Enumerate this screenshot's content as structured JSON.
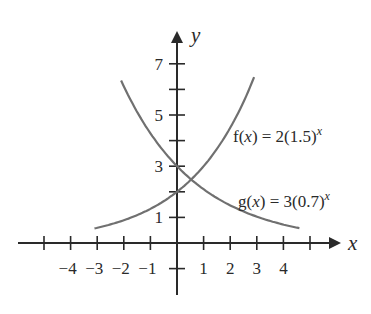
{
  "chart_data": {
    "type": "line",
    "title": "",
    "xlabel": "x",
    "ylabel": "y",
    "xlim": [
      -5.2,
      6.2
    ],
    "ylim": [
      -2.5,
      8.2
    ],
    "grid": false,
    "x_ticks": [
      -5,
      -4,
      -3,
      -2,
      -1,
      1,
      2,
      3,
      4,
      5
    ],
    "x_tick_labels": [
      "-4",
      "-3",
      "-2",
      "-1",
      "1",
      "2",
      "3",
      "4"
    ],
    "x_tick_label_values": [
      -4,
      -3,
      -2,
      -1,
      1,
      2,
      3,
      4
    ],
    "y_ticks": [
      -1,
      1,
      2,
      3,
      4,
      5,
      6,
      7
    ],
    "y_tick_labels": [
      "1",
      "3",
      "5",
      "7"
    ],
    "y_tick_label_values": [
      1,
      3,
      5,
      7
    ],
    "series": [
      {
        "name": "f(x) = 2(1.5)^x",
        "label_main": "f(",
        "label_var": "x",
        "label_rest": ") = 2(1.5)",
        "label_exp": "x",
        "base": 1.5,
        "coef": 2,
        "x_range": [
          -3.1,
          2.9
        ],
        "x": [
          -3,
          -2,
          -1,
          0,
          1,
          2,
          2.9
        ],
        "values": [
          0.59,
          0.89,
          1.33,
          2,
          3,
          4.5,
          6.0
        ],
        "color": "#707070"
      },
      {
        "name": "g(x) = 3(0.7)^x",
        "label_main": "g(",
        "label_var": "x",
        "label_rest": ") = 3(0.7)",
        "label_exp": "x",
        "base": 0.7,
        "coef": 3,
        "x_range": [
          -2.1,
          4.6
        ],
        "x": [
          -2,
          -1,
          0,
          1,
          2,
          3,
          4,
          4.6
        ],
        "values": [
          6.12,
          4.29,
          3,
          2.1,
          1.47,
          1.03,
          0.72,
          0.58
        ],
        "color": "#707070"
      }
    ],
    "annotations": [
      "f(x) = 2(1.5)^x",
      "g(x) = 3(0.7)^x"
    ]
  }
}
